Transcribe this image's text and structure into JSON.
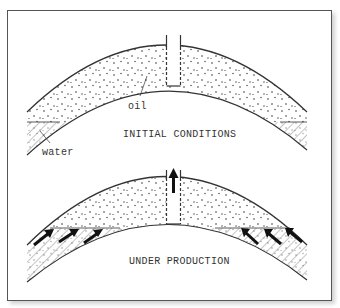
{
  "figure": {
    "panels": [
      {
        "id": "initial",
        "title": "INITIAL CONDITIONS",
        "labels": {
          "oil": "oil",
          "water": "water"
        }
      },
      {
        "id": "production",
        "title": "UNDER PRODUCTION"
      }
    ],
    "colors": {
      "line": "#333333",
      "frame": "#555555",
      "background": "#ffffff",
      "arrow": "#111111"
    }
  }
}
